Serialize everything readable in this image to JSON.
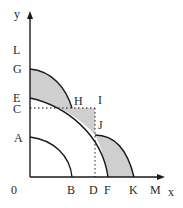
{
  "diagram": {
    "axes": {
      "y_label": "y",
      "x_label": "x",
      "origin_label": "0"
    },
    "y_axis_labels": [
      "L",
      "G",
      "E",
      "C",
      "A"
    ],
    "x_axis_labels": [
      "B",
      "D",
      "F",
      "K",
      "M"
    ],
    "point_labels": [
      "H",
      "I",
      "J"
    ],
    "labels": {
      "y": "y",
      "x": "x",
      "origin": "0",
      "L": "L",
      "G": "G",
      "E": "E",
      "C": "C",
      "A": "A",
      "B": "B",
      "D": "D",
      "F": "F",
      "K": "K",
      "M": "M",
      "H": "H",
      "I": "I",
      "J": "J"
    },
    "curves": [
      {
        "name": "AB",
        "from": "A",
        "to": "B"
      },
      {
        "name": "EF",
        "from": "E",
        "to": "F"
      },
      {
        "name": "GH",
        "from": "G",
        "to": "H"
      },
      {
        "name": "JK",
        "from": "J",
        "to": "K"
      }
    ],
    "dotted_lines": [
      {
        "from": "C",
        "to": "I"
      },
      {
        "from": "I",
        "to": "D"
      }
    ],
    "colors": {
      "axis": "#1a1a1a",
      "curve": "#1a1a1a",
      "shaded": "#cfcfcf",
      "dotted": "#555555"
    }
  }
}
